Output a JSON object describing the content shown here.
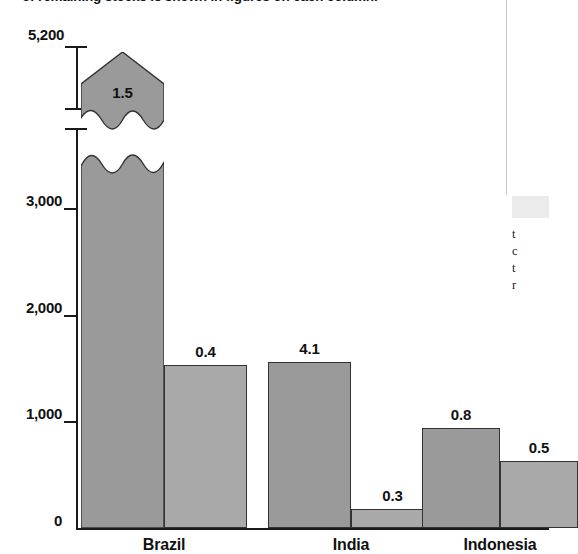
{
  "caption": {
    "partial_line": "of remaining stocks is shown in figures on each column."
  },
  "sidebar": {
    "fragment_lines": [
      "t",
      "c",
      "t",
      "r"
    ]
  },
  "chart_data": {
    "type": "bar",
    "title": "",
    "subtitle": "",
    "xlabel": "",
    "ylabel": "",
    "categories": [
      "Brazil",
      "India",
      "Indonesia"
    ],
    "series": [
      {
        "name": "series-1",
        "color": "#9a9a9a",
        "values": [
          5200,
          1560,
          940
        ],
        "point_labels": [
          "1.5",
          "4.1",
          "0.8"
        ]
      },
      {
        "name": "series-2",
        "color": "#a9a9a9",
        "values": [
          1530,
          180,
          630
        ],
        "point_labels": [
          "0.4",
          "0.3",
          "0.5"
        ]
      }
    ],
    "ylim": [
      0,
      5200
    ],
    "axis_break": {
      "present": true,
      "below": 3700,
      "above": 4600
    },
    "yticks": [
      0,
      1000,
      2000,
      3000,
      5200
    ],
    "ytick_labels": [
      "0",
      "1,000",
      "2,000",
      "3,000",
      "5,200"
    ],
    "grid": false,
    "legend_position": "none",
    "value_labels_on_bars": true,
    "broken_bars": [
      "Brazil:series-1"
    ]
  }
}
